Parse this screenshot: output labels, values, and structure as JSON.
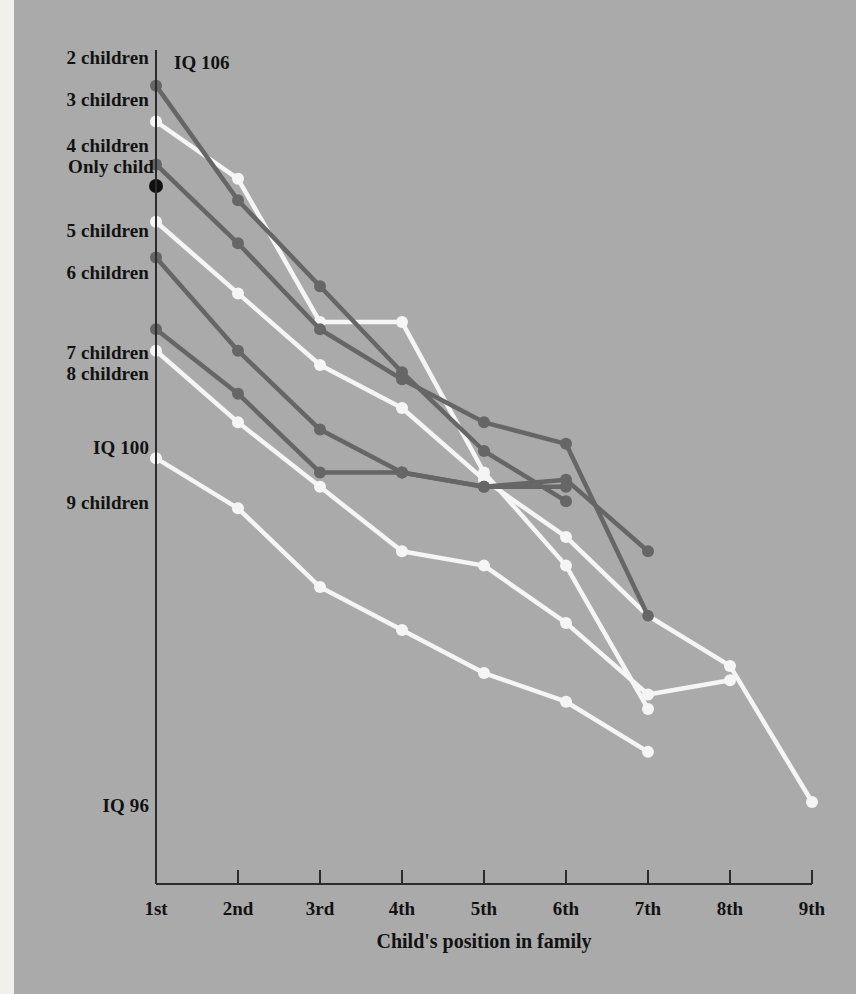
{
  "figure": {
    "background_color": "#aaaaaa",
    "margin_color": "#f2f0ec"
  },
  "annotations": {
    "iq_106": "IQ 106",
    "iq_100": "IQ 100",
    "iq_96": "IQ 96"
  },
  "axis": {
    "x_title": "Child's position in family",
    "x_ticks": [
      "1st",
      "2nd",
      "3rd",
      "4th",
      "5th",
      "6th",
      "7th",
      "8th",
      "9th"
    ],
    "axis_color": "#2b2b2b"
  },
  "series_labels": {
    "two": "2 children",
    "three": "3 children",
    "four": "4 children",
    "only": "Only child",
    "five": "5 children",
    "six": "6 children",
    "seven": "7 children",
    "eight": "8 children",
    "nine": "9 children"
  },
  "chart_data": {
    "type": "line",
    "title": "",
    "xlabel": "Child's position in family",
    "ylabel": "IQ",
    "categories": [
      "1st",
      "2nd",
      "3rd",
      "4th",
      "5th",
      "6th",
      "7th",
      "8th",
      "9th"
    ],
    "ylim": [
      95.4,
      106.4
    ],
    "y_reference_labels": [
      {
        "label": "IQ 106",
        "value": 106.0
      },
      {
        "label": "IQ 100",
        "value": 100.0
      },
      {
        "label": "IQ 96",
        "value": 96.0
      }
    ],
    "grid": false,
    "legend": "inline-left-of-axis",
    "colors": {
      "dark": "#666666",
      "light": "#f5f5f5",
      "only_child_marker": "#101010"
    },
    "series": [
      {
        "name": "Only child",
        "color": "#101010",
        "style": "marker-only",
        "x": [
          "1st"
        ],
        "values": [
          104.6
        ]
      },
      {
        "name": "2 children",
        "color": "#666666",
        "x": [
          "1st",
          "2nd",
          "3rd",
          "4th",
          "5th",
          "6th"
        ],
        "values": [
          106.0,
          104.4,
          103.2,
          102.0,
          100.9,
          100.2
        ]
      },
      {
        "name": "3 children",
        "color": "#f5f5f5",
        "x": [
          "1st",
          "2nd",
          "3rd",
          "4th",
          "5th",
          "6th",
          "7th"
        ],
        "values": [
          105.5,
          104.7,
          102.7,
          102.7,
          100.6,
          99.3,
          97.3
        ]
      },
      {
        "name": "4 children",
        "color": "#666666",
        "x": [
          "1st",
          "2nd",
          "3rd",
          "4th",
          "5th",
          "6th",
          "7th"
        ],
        "values": [
          104.9,
          103.8,
          102.6,
          101.9,
          101.3,
          101.0,
          98.6
        ]
      },
      {
        "name": "5 children",
        "color": "#f5f5f5",
        "x": [
          "1st",
          "2nd",
          "3rd",
          "4th",
          "5th",
          "6th",
          "7th",
          "8th",
          "9th"
        ],
        "values": [
          104.1,
          103.1,
          102.1,
          101.5,
          100.5,
          99.7,
          98.6,
          97.9,
          96.0
        ]
      },
      {
        "name": "6 children",
        "color": "#666666",
        "x": [
          "1st",
          "2nd",
          "3rd",
          "4th",
          "5th",
          "6th"
        ],
        "values": [
          103.6,
          102.3,
          101.2,
          100.6,
          100.4,
          100.4
        ]
      },
      {
        "name": "7 children",
        "color": "#666666",
        "x": [
          "1st",
          "2nd",
          "3rd",
          "4th",
          "5th",
          "6th",
          "7th"
        ],
        "values": [
          102.6,
          101.7,
          100.6,
          100.6,
          100.4,
          100.5,
          99.5
        ]
      },
      {
        "name": "8 children",
        "color": "#f5f5f5",
        "x": [
          "1st",
          "2nd",
          "3rd",
          "4th",
          "5th",
          "6th",
          "7th",
          "8th"
        ],
        "values": [
          102.3,
          101.3,
          100.4,
          99.5,
          99.3,
          98.5,
          97.5,
          97.7
        ]
      },
      {
        "name": "9 children",
        "color": "#f5f5f5",
        "x": [
          "1st",
          "2nd",
          "3rd",
          "4th",
          "5th",
          "6th",
          "7th"
        ],
        "values": [
          100.8,
          100.1,
          99.0,
          98.4,
          97.8,
          97.4,
          96.7
        ]
      }
    ]
  }
}
